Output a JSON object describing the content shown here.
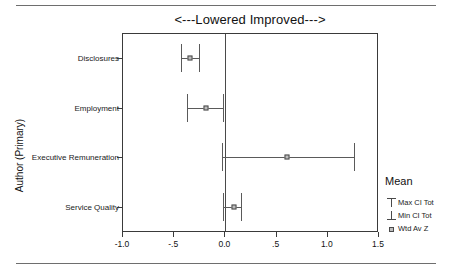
{
  "figure": {
    "title": "<---Lowered   Improved--->",
    "has_top_rule": true,
    "has_bottom_rule": true
  },
  "legend": {
    "title": "Mean",
    "entries": [
      {
        "label": "Max CI Tot",
        "key": "max-ci-whisker-icon"
      },
      {
        "label": "Min CI Tot",
        "key": "min-ci-whisker-icon"
      },
      {
        "label": "Wtd Av Z",
        "key": "weighted-average-marker-icon"
      }
    ]
  },
  "chart_data": {
    "type": "scatter",
    "title": "<---Lowered   Improved--->",
    "xlabel": "",
    "ylabel": "Author (Primary)",
    "xlim": [
      -1.0,
      1.5
    ],
    "xticks": [
      -1.0,
      -0.5,
      0.0,
      0.5,
      1.0,
      1.5
    ],
    "xticklabels": [
      "-1.0",
      "-.5",
      "0.0",
      ".5",
      "1.0",
      "1.5"
    ],
    "grid": false,
    "reference_line": 0.0,
    "legend_position": "right",
    "categories": [
      "Disclosures",
      "Employment",
      "Executive Remuneration",
      "Service Quality"
    ],
    "series": [
      {
        "name": "Wtd Av Z",
        "values": [
          -0.34,
          -0.18,
          0.61,
          0.09
        ]
      },
      {
        "name": "Min CI Tot",
        "values": [
          -0.42,
          -0.37,
          -0.02,
          -0.01
        ]
      },
      {
        "name": "Max CI Tot",
        "values": [
          -0.25,
          -0.01,
          1.27,
          0.16
        ]
      }
    ]
  }
}
